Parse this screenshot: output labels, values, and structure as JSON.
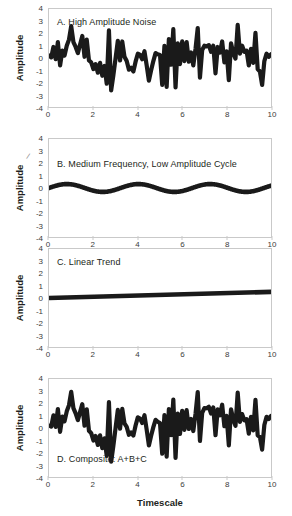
{
  "figure": {
    "axis_labels": {
      "y": "Amplitude",
      "x": "Timescale"
    },
    "yticks": [
      "4",
      "3",
      "2",
      "1",
      "0",
      "-1",
      "-2",
      "-3",
      "-4"
    ],
    "xticks": [
      "0",
      "2",
      "4",
      "6",
      "8",
      "10"
    ],
    "line_color": "#1a1a1a",
    "frame_color": "#c9c9c9",
    "stray_mark": "/"
  },
  "chart_data": [
    {
      "type": "line",
      "panel": "A",
      "title": "A. High Amplitude Noise",
      "xlabel": "",
      "ylabel": "Amplitude",
      "xlim": [
        0,
        10
      ],
      "ylim": [
        -4,
        4
      ],
      "grid": false,
      "legend": "none",
      "x": [
        0.0,
        0.1,
        0.2,
        0.3,
        0.4,
        0.5,
        0.6,
        0.7,
        0.8,
        0.9,
        1.0,
        1.1,
        1.2,
        1.3,
        1.4,
        1.5,
        1.6,
        1.7,
        1.8,
        1.9,
        2.0,
        2.1,
        2.2,
        2.3,
        2.4,
        2.5,
        2.6,
        2.7,
        2.8,
        2.9,
        3.0,
        3.1,
        3.2,
        3.3,
        3.4,
        3.5,
        3.6,
        3.7,
        3.8,
        3.9,
        4.0,
        4.1,
        4.2,
        4.3,
        4.4,
        4.5,
        4.6,
        4.7,
        4.8,
        4.9,
        5.0,
        5.1,
        5.2,
        5.3,
        5.4,
        5.5,
        5.6,
        5.7,
        5.8,
        5.9,
        6.0,
        6.1,
        6.2,
        6.3,
        6.4,
        6.5,
        6.6,
        6.7,
        6.8,
        6.9,
        7.0,
        7.1,
        7.2,
        7.3,
        7.4,
        7.5,
        7.6,
        7.7,
        7.8,
        7.9,
        8.0,
        8.1,
        8.2,
        8.3,
        8.4,
        8.5,
        8.6,
        8.7,
        8.8,
        8.9,
        9.0,
        9.1,
        9.2,
        9.3,
        9.4,
        9.5,
        9.6,
        9.7,
        9.8,
        9.9,
        10.0
      ],
      "values": [
        0.2,
        0.05,
        0.9,
        -0.1,
        1.3,
        -0.6,
        0.6,
        0.2,
        1.0,
        1.5,
        2.6,
        1.3,
        0.9,
        0.4,
        1.1,
        1.8,
        0.1,
        1.5,
        -0.2,
        -0.35,
        -0.9,
        -0.5,
        -1.2,
        -0.4,
        -1.45,
        -0.65,
        -2.1,
        2.25,
        -2.65,
        -1.4,
        0.0,
        1.4,
        -0.2,
        1.35,
        0.1,
        -0.25,
        -0.95,
        -0.8,
        -1.1,
        -0.3,
        0.35,
        0.25,
        -0.1,
        0.55,
        -0.6,
        -1.85,
        -1.0,
        -0.25,
        0.4,
        0.3,
        0.25,
        -2.2,
        1.0,
        -2.35,
        1.55,
        -0.55,
        2.35,
        -2.4,
        1.2,
        -0.5,
        1.35,
        -0.25,
        1.3,
        -0.3,
        0.45,
        -0.6,
        0.75,
        2.45,
        -1.6,
        0.65,
        1.0,
        0.95,
        1.05,
        0.5,
        1.0,
        -1.25,
        0.9,
        0.45,
        1.35,
        -0.35,
        0.55,
        -1.8,
        1.2,
        0.4,
        -0.05,
        2.7,
        0.35,
        1.0,
        0.5,
        0.6,
        -0.6,
        0.75,
        -0.4,
        2.05,
        -0.9,
        -1.1,
        -2.2,
        -0.25,
        0.35,
        0.1,
        0.3
      ]
    },
    {
      "type": "line",
      "panel": "B",
      "title": "B. Medium Frequency, Low Amplitude Cycle",
      "xlabel": "",
      "ylabel": "Amplitude",
      "xlim": [
        0,
        10
      ],
      "ylim": [
        -4,
        4
      ],
      "grid": false,
      "legend": "none",
      "description": "sine wave, amplitude 0.32, about 3 cycles across 0 to 10",
      "amplitude": 0.32,
      "cycles": 3.1,
      "phase": 0.0
    },
    {
      "type": "line",
      "panel": "C",
      "title": "C. Linear Trend",
      "xlabel": "",
      "ylabel": "Amplitude",
      "xlim": [
        0,
        10
      ],
      "ylim": [
        -4,
        4
      ],
      "grid": false,
      "legend": "none",
      "description": "straight line from 0.0 at x=0 to 0.5 at x=10",
      "intercept": 0.0,
      "slope": 0.05
    },
    {
      "type": "line",
      "panel": "D",
      "title": "D. Composite: A+B+C",
      "xlabel": "Timescale",
      "ylabel": "Amplitude",
      "xlim": [
        0,
        10
      ],
      "ylim": [
        -4,
        4
      ],
      "grid": false,
      "legend": "none",
      "description": "sum of panels A, B and C"
    }
  ]
}
